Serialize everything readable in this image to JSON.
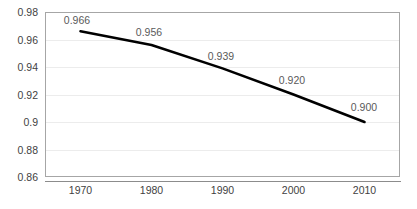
{
  "chart_data": {
    "type": "line",
    "title": "",
    "subtitle": "",
    "xlabel": "",
    "ylabel": "",
    "categories": [
      "1970",
      "1980",
      "1990",
      "2000",
      "2010"
    ],
    "x": [
      1970,
      1980,
      1990,
      2000,
      2010
    ],
    "values": [
      0.966,
      0.956,
      0.939,
      0.92,
      0.9
    ],
    "point_labels": [
      "0.966",
      "0.956",
      "0.939",
      "0.920",
      "0.900"
    ],
    "series": [
      {
        "name": "",
        "values": [
          0.966,
          0.956,
          0.939,
          0.92,
          0.9
        ],
        "color": "#000000"
      }
    ],
    "ylim": [
      0.86,
      0.98
    ],
    "yticks": [
      0.98,
      0.96,
      0.94,
      0.92,
      0.9,
      0.88,
      0.86
    ],
    "ytick_labels": [
      "0.98",
      "0.96",
      "0.94",
      "0.92",
      "0.9",
      "0.88",
      "0.86"
    ],
    "xticks": [
      1970,
      1980,
      1990,
      2000,
      2010
    ],
    "xtick_labels": [
      "1970",
      "1980",
      "1990",
      "2000",
      "2010"
    ],
    "grid": "horizontal",
    "legend": "none",
    "annotations": [],
    "colors": {
      "line": "#000000",
      "gridline": "#ececec",
      "plot_border": "#a6a6a6",
      "axis_line": "#8c8c8c",
      "tick_text": "#3f3f3f",
      "data_label_text": "#5a5a5a",
      "background": "#ffffff"
    }
  }
}
